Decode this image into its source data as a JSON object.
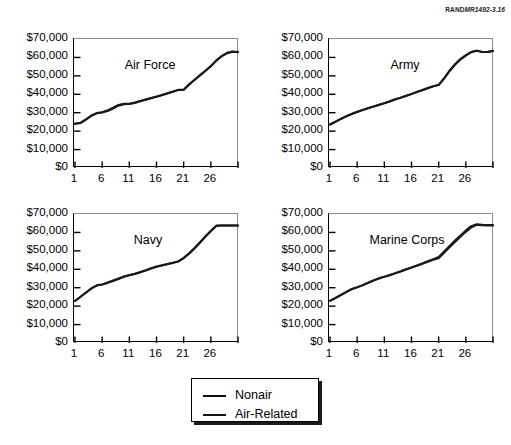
{
  "source_tag": {
    "publisher": "RAND",
    "document_id": "MR1492-3.16"
  },
  "legend": {
    "entries": [
      {
        "label": "Nonair",
        "color": "#111111"
      },
      {
        "label": "Air-Related",
        "color": "#111111"
      }
    ]
  },
  "chart_data": [
    {
      "type": "line",
      "title": "Air Force",
      "xlabel": "",
      "ylabel": "",
      "xlim": [
        1,
        31
      ],
      "ylim": [
        0,
        70000
      ],
      "grid": false,
      "legend_position": "below-figure",
      "ytick_labels": [
        "$70,000",
        "$60,000",
        "$50,000",
        "$40,000",
        "$30,000",
        "$20,000",
        "$10,000",
        "$0"
      ],
      "ytick_values": [
        70000,
        60000,
        50000,
        40000,
        30000,
        20000,
        10000,
        0
      ],
      "xtick_values": [
        1,
        6,
        11,
        16,
        21,
        26,
        31
      ],
      "xtick_labels": [
        "1",
        "6",
        "11",
        "16",
        "21",
        "26",
        ""
      ],
      "x": [
        1,
        2,
        3,
        4,
        5,
        6,
        7,
        8,
        9,
        10,
        11,
        12,
        13,
        14,
        15,
        16,
        17,
        18,
        19,
        20,
        21,
        22,
        23,
        24,
        25,
        26,
        27,
        28,
        29,
        30,
        31
      ],
      "series": [
        {
          "name": "Nonair",
          "values": [
            24000,
            24400,
            26200,
            28300,
            29700,
            30100,
            30900,
            32200,
            33800,
            34600,
            34700,
            35300,
            36200,
            37000,
            37800,
            38600,
            39500,
            40400,
            41300,
            42300,
            42400,
            45200,
            47700,
            50200,
            52600,
            55200,
            58200,
            60600,
            62300,
            63100,
            62800
          ]
        },
        {
          "name": "Air-Related",
          "values": [
            24000,
            24500,
            26400,
            28500,
            29800,
            30300,
            31300,
            32700,
            34200,
            34900,
            34900,
            35500,
            36400,
            37200,
            38000,
            38800,
            39700,
            40600,
            41500,
            42400,
            42500,
            45400,
            47900,
            50400,
            52800,
            55400,
            58400,
            60800,
            62500,
            63200,
            62900
          ]
        }
      ]
    },
    {
      "type": "line",
      "title": "Army",
      "xlabel": "",
      "ylabel": "",
      "xlim": [
        1,
        31
      ],
      "ylim": [
        0,
        70000
      ],
      "grid": false,
      "legend_position": "below-figure",
      "ytick_labels": [
        "$70,000",
        "$60,000",
        "$50,000",
        "$40,000",
        "$30,000",
        "$20,000",
        "$10,000",
        "$0"
      ],
      "ytick_values": [
        70000,
        60000,
        50000,
        40000,
        30000,
        20000,
        10000,
        0
      ],
      "xtick_values": [
        1,
        6,
        11,
        16,
        21,
        26,
        31
      ],
      "xtick_labels": [
        "1",
        "6",
        "11",
        "16",
        "21",
        "26",
        ""
      ],
      "x": [
        1,
        2,
        3,
        4,
        5,
        6,
        7,
        8,
        9,
        10,
        11,
        12,
        13,
        14,
        15,
        16,
        17,
        18,
        19,
        20,
        21,
        22,
        23,
        24,
        25,
        26,
        27,
        28,
        29,
        30,
        31
      ],
      "series": [
        {
          "name": "Nonair",
          "values": [
            23600,
            25000,
            26600,
            28000,
            29300,
            30400,
            31400,
            32400,
            33300,
            34200,
            35100,
            36100,
            37200,
            38100,
            39100,
            40100,
            41200,
            42200,
            43300,
            44300,
            45000,
            48500,
            52500,
            56000,
            58800,
            61000,
            62800,
            63600,
            62900,
            62900,
            63500
          ]
        },
        {
          "name": "Air-Related",
          "values": [
            23600,
            25100,
            26700,
            28100,
            29400,
            30500,
            31500,
            32500,
            33400,
            34300,
            35200,
            36200,
            37300,
            38200,
            39200,
            40200,
            41300,
            42300,
            43400,
            44400,
            45100,
            48700,
            52800,
            56300,
            59100,
            61300,
            63000,
            63700,
            63000,
            63000,
            63600
          ]
        }
      ]
    },
    {
      "type": "line",
      "title": "Navy",
      "xlabel": "",
      "ylabel": "",
      "xlim": [
        1,
        31
      ],
      "ylim": [
        0,
        70000
      ],
      "grid": false,
      "legend_position": "below-figure",
      "ytick_labels": [
        "$70,000",
        "$60,000",
        "$50,000",
        "$40,000",
        "$30,000",
        "$20,000",
        "$10,000",
        "$0"
      ],
      "ytick_values": [
        70000,
        60000,
        50000,
        40000,
        30000,
        20000,
        10000,
        0
      ],
      "xtick_values": [
        1,
        6,
        11,
        16,
        21,
        26,
        31
      ],
      "xtick_labels": [
        "1",
        "6",
        "11",
        "16",
        "21",
        "26",
        ""
      ],
      "x": [
        1,
        2,
        3,
        4,
        5,
        6,
        7,
        8,
        9,
        10,
        11,
        12,
        13,
        14,
        15,
        16,
        17,
        18,
        19,
        20,
        21,
        22,
        23,
        24,
        25,
        26,
        27,
        28,
        29,
        30,
        31
      ],
      "series": [
        {
          "name": "Nonair",
          "values": [
            22800,
            25000,
            27300,
            29500,
            31200,
            31700,
            32600,
            33600,
            34700,
            35900,
            36700,
            37400,
            38300,
            39300,
            40400,
            41300,
            42000,
            42700,
            43400,
            44200,
            46000,
            48400,
            51300,
            54400,
            57600,
            60600,
            63500,
            63700,
            63700,
            63700,
            63700
          ]
        },
        {
          "name": "Air-Related",
          "values": [
            22800,
            25100,
            27400,
            29600,
            31300,
            31800,
            32800,
            33900,
            35000,
            36100,
            36900,
            37600,
            38500,
            39500,
            40600,
            41500,
            42200,
            42900,
            43600,
            44300,
            46200,
            48700,
            51600,
            54700,
            57900,
            60900,
            63700,
            63800,
            63800,
            63800,
            63800
          ]
        }
      ]
    },
    {
      "type": "line",
      "title": "Marine Corps",
      "xlabel": "",
      "ylabel": "",
      "xlim": [
        1,
        31
      ],
      "ylim": [
        0,
        70000
      ],
      "grid": false,
      "legend_position": "below-figure",
      "ytick_labels": [
        "$70,000",
        "$60,000",
        "$50,000",
        "$40,000",
        "$30,000",
        "$20,000",
        "$10,000",
        "$0"
      ],
      "ytick_values": [
        70000,
        60000,
        50000,
        40000,
        30000,
        20000,
        10000,
        0
      ],
      "xtick_values": [
        1,
        6,
        11,
        16,
        21,
        26,
        31
      ],
      "xtick_labels": [
        "1",
        "6",
        "11",
        "16",
        "21",
        "26",
        ""
      ],
      "x": [
        1,
        2,
        3,
        4,
        5,
        6,
        7,
        8,
        9,
        10,
        11,
        12,
        13,
        14,
        15,
        16,
        17,
        18,
        19,
        20,
        21,
        22,
        23,
        24,
        25,
        26,
        27,
        28,
        29,
        30,
        31
      ],
      "series": [
        {
          "name": "Nonair",
          "values": [
            22900,
            24400,
            26000,
            27600,
            29200,
            30200,
            31300,
            32600,
            33900,
            35000,
            35900,
            36800,
            37800,
            38800,
            39900,
            40900,
            41900,
            43000,
            44100,
            45200,
            46000,
            48900,
            51900,
            54800,
            57600,
            60300,
            62700,
            64100,
            63900,
            63800,
            63800
          ]
        },
        {
          "name": "Air-Related",
          "values": [
            22900,
            24500,
            26100,
            27700,
            29300,
            30300,
            31400,
            32700,
            34000,
            35100,
            36000,
            36900,
            37900,
            38900,
            40000,
            41000,
            42100,
            43200,
            44400,
            45500,
            46700,
            49700,
            52700,
            55600,
            58400,
            61100,
            63400,
            64500,
            64200,
            64000,
            64000
          ]
        }
      ]
    }
  ]
}
